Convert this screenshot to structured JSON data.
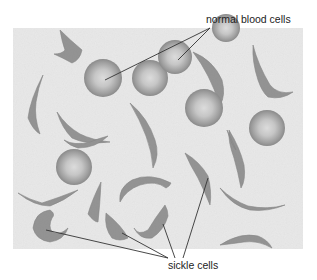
{
  "labels": {
    "normal": "normal blood cells",
    "sickle": "sickle cells"
  },
  "colors": {
    "background": "#ffffff",
    "slide": "#e9e9e9",
    "normal_cell_edge": "#8a8a8a",
    "normal_cell_center": "#d8d8d8",
    "sickle_cell": "#8c8c8c",
    "leader_line": "#333333",
    "text": "#222222"
  },
  "normal_cells": [
    {
      "cx": 103,
      "cy": 78,
      "r": 19
    },
    {
      "cx": 150,
      "cy": 78,
      "r": 18
    },
    {
      "cx": 175,
      "cy": 57,
      "r": 17
    },
    {
      "cx": 226,
      "cy": 28,
      "r": 14
    },
    {
      "cx": 204,
      "cy": 108,
      "r": 19
    },
    {
      "cx": 267,
      "cy": 128,
      "r": 18
    },
    {
      "cx": 74,
      "cy": 167,
      "r": 18
    }
  ],
  "sickle_cells_count": 18,
  "leader_lines": {
    "normal": [
      {
        "x1": 210,
        "y1": 28,
        "x2": 105,
        "y2": 80
      },
      {
        "x1": 210,
        "y1": 28,
        "x2": 178,
        "y2": 60
      }
    ],
    "sickle": [
      {
        "x1": 168,
        "y1": 258,
        "x2": 46,
        "y2": 230
      },
      {
        "x1": 168,
        "y1": 258,
        "x2": 122,
        "y2": 233
      },
      {
        "x1": 175,
        "y1": 258,
        "x2": 163,
        "y2": 224
      },
      {
        "x1": 183,
        "y1": 258,
        "x2": 208,
        "y2": 178
      }
    ]
  }
}
